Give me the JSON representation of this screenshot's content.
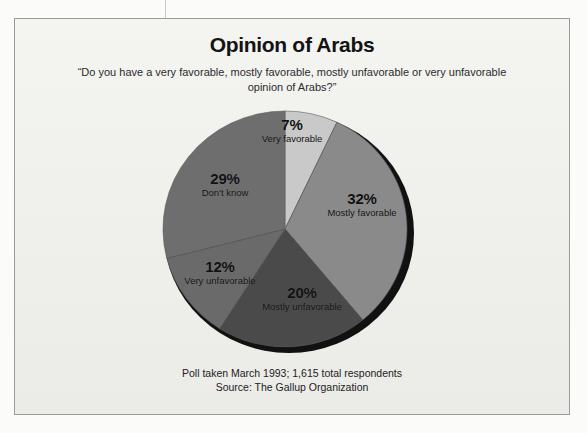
{
  "chart_data": {
    "type": "pie",
    "title": "Opinion of Arabs",
    "subtitle": "“Do you have a very favorable, mostly favorable, mostly unfavorable or very unfavorable opinion of Arabs?”",
    "categories": [
      "Very favorable",
      "Mostly favorable",
      "Mostly unfavorable",
      "Very unfavorable",
      "Don't know"
    ],
    "values": [
      7,
      32,
      20,
      12,
      29
    ],
    "value_labels": [
      "7%",
      "32%",
      "20%",
      "12%",
      "29%"
    ],
    "colors": [
      "#c9c9c9",
      "#8a8a8a",
      "#4a4a4a",
      "#6a6a6a",
      "#6e6e6e"
    ],
    "start_angle_deg": 0,
    "direction": "clockwise",
    "legend": "none",
    "grid": false,
    "shadow_color": "#111111",
    "source_line_1": "Poll taken March 1993; 1,615 total respondents",
    "source_line_2": "Source: The Gallup Organization"
  },
  "footer": {
    "line1": "Poll taken March 1993; 1,615 total respondents",
    "line2": "Source: The Gallup Organization"
  }
}
